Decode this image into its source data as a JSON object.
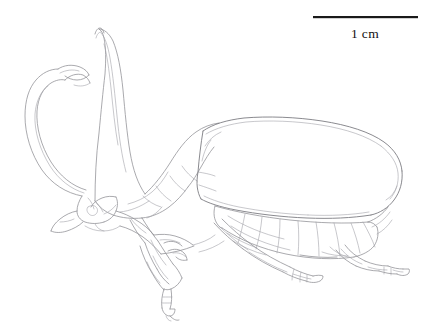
{
  "figure": {
    "kind": "scientific-line-drawing",
    "background_color": "#ffffff",
    "line_color": "#8d8d93"
  },
  "scale_bar": {
    "label": "1 cm",
    "bar_color": "#1a1a1a",
    "x_start": 313,
    "x_end": 418,
    "y": 17,
    "thickness": 2,
    "label_x": 365,
    "label_y": 36
  },
  "anatomy": {
    "parts": [
      {
        "name": "cephalic-horn",
        "label": "cephalic horn",
        "tip": "bifurcated"
      },
      {
        "name": "thoracic-horn",
        "label": "thoracic horn",
        "tip": "blunt-recurved"
      },
      {
        "name": "head-capsule",
        "label": "head"
      },
      {
        "name": "pronotum",
        "label": "pronotum"
      },
      {
        "name": "elytron",
        "label": "elytron"
      },
      {
        "name": "abdominal-sternites",
        "label": "abdominal sternites"
      },
      {
        "name": "pygidium",
        "label": "pygidium"
      },
      {
        "name": "foreleg",
        "label": "foreleg"
      },
      {
        "name": "midleg",
        "label": "midleg"
      },
      {
        "name": "hindleg",
        "label": "hindleg"
      }
    ]
  }
}
